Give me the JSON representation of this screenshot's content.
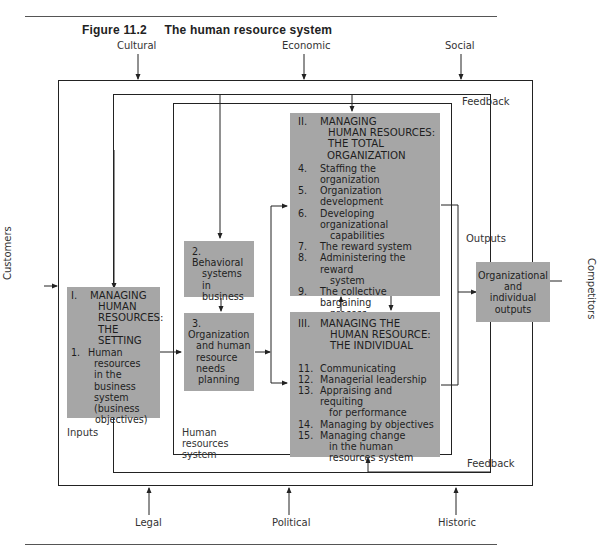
{
  "figure": {
    "number": "Figure 11.2",
    "title": "The human resource system"
  },
  "environment": {
    "top": [
      "Cultural",
      "Economic",
      "Social"
    ],
    "bottom": [
      "Legal",
      "Political",
      "Historic"
    ],
    "left": "Customers",
    "right": "Competitors"
  },
  "labels": {
    "feedback_top": "Feedback",
    "feedback_bottom": "Feedback",
    "outputs": "Outputs",
    "inputs": "Inputs",
    "hr_system": [
      "Human",
      "resources",
      "system"
    ]
  },
  "boxes": {
    "setting": {
      "roman": "I.",
      "heading": [
        "MANAGING",
        "HUMAN",
        "RESOURCES:",
        "THE SETTING"
      ],
      "items": [
        {
          "num": "1.",
          "lines": [
            "Human",
            "resources",
            "in the",
            "business",
            "system",
            "(business",
            "objectives)"
          ]
        }
      ]
    },
    "behavioral": {
      "num": "2.",
      "lines": [
        "Behavioral",
        "systems in",
        "business"
      ]
    },
    "planning": {
      "num": "3.",
      "lines": [
        "Organization",
        "and human",
        "resource",
        "needs",
        "planning"
      ]
    },
    "total_org": {
      "roman": "II.",
      "heading": [
        "MANAGING",
        "HUMAN RESOURCES:",
        "THE TOTAL",
        "ORGANIZATION"
      ],
      "items": [
        {
          "num": "4.",
          "lines": [
            "Staffing the organization"
          ]
        },
        {
          "num": "5.",
          "lines": [
            "Organization development"
          ]
        },
        {
          "num": "6.",
          "lines": [
            "Developing organizational",
            "capabilities"
          ]
        },
        {
          "num": "7.",
          "lines": [
            "The reward system"
          ]
        },
        {
          "num": "8.",
          "lines": [
            "Administering the reward",
            "system"
          ]
        },
        {
          "num": "9.",
          "lines": [
            "The collective bargaining",
            "process"
          ]
        },
        {
          "num": "10.",
          "lines": [
            "Measuring and controlling",
            "organizational",
            "performance"
          ]
        }
      ]
    },
    "individual": {
      "roman": "III.",
      "heading": [
        "MANAGING THE",
        "HUMAN RESOURCE:",
        "THE INDIVIDUAL"
      ],
      "items": [
        {
          "num": "11.",
          "lines": [
            "Communicating"
          ]
        },
        {
          "num": "12.",
          "lines": [
            "Managerial leadership"
          ]
        },
        {
          "num": "13.",
          "lines": [
            "Appraising and requiting",
            "for performance"
          ]
        },
        {
          "num": "14.",
          "lines": [
            "Managing by objectives"
          ]
        },
        {
          "num": "15.",
          "lines": [
            "Managing change",
            "in the human",
            "resources system"
          ]
        }
      ]
    },
    "outputs": {
      "lines": [
        "Organizational",
        "and",
        "individual",
        "outputs"
      ]
    }
  },
  "colors": {
    "box_fill": "#a6a6a6",
    "line": "#222222"
  }
}
